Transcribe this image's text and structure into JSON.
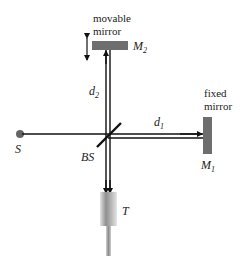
{
  "diagram": {
    "labels": {
      "movable_mirror_line1": "movable",
      "movable_mirror_line2": "mirror",
      "m2": "M",
      "m2_sub": "2",
      "fixed_mirror_line1": "fixed",
      "fixed_mirror_line2": "mirror",
      "m1": "M",
      "m1_sub": "1",
      "d2": "d",
      "d2_sub": "2",
      "d1": "d",
      "d1_sub": "1",
      "source": "S",
      "beam_splitter": "BS",
      "telescope": "T"
    },
    "colors": {
      "mirror": "#6e6e6e",
      "beam": "#111111",
      "source": "#666666",
      "telescope_light": "#d6d6d6",
      "telescope_dark": "#8a8a8a"
    }
  }
}
